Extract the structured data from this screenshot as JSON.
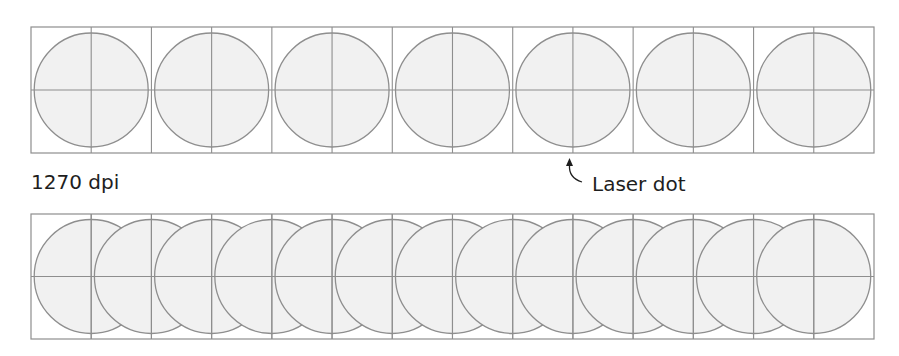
{
  "diagram": {
    "labels": {
      "resolution": "1270 dpi",
      "annotation": "Laser dot"
    },
    "colors": {
      "background": "#ffffff",
      "dot_fill": "#f1f1f1",
      "stroke": "#8e8e8e",
      "text": "#1e1e1e"
    },
    "top_row": {
      "x": 31,
      "y": 27,
      "width": 843,
      "height": 126,
      "cells": 7,
      "dot_radius": 57,
      "dot_count": 7,
      "dot_spacing": 120.43,
      "first_dot_cx": 91.2
    },
    "bottom_row": {
      "x": 31,
      "y": 214,
      "width": 843,
      "height": 125,
      "cells": 14,
      "dot_radius": 57,
      "dot_count": 13,
      "dot_spacing": 60.21,
      "first_dot_cx": 91.2
    }
  }
}
